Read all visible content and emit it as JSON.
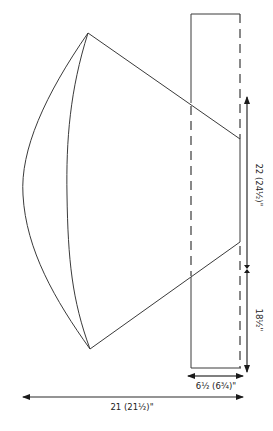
{
  "diagram": {
    "type": "knitting-schematic",
    "measurements": {
      "length_upper": "22 (24½)\"",
      "length_lower": "18½\"",
      "width_cuff": "6½ (6¾)\"",
      "width_total": "21 (21½)\""
    },
    "colors": {
      "line": "#3a3a3a",
      "background": "#ffffff"
    }
  }
}
